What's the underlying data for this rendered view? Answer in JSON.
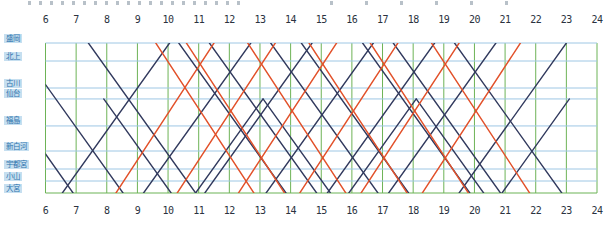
{
  "page": {
    "background_color": "#ffffff",
    "description_labels": {
      "top_axis": "time-of-day (hours)",
      "bottom_axis": "time-of-day (hours)",
      "left_column": "station names"
    }
  },
  "chart_data": {
    "type": "line",
    "title": "",
    "xlabel": "",
    "ylabel": "",
    "x_range": [
      6,
      24
    ],
    "tick_labels": [
      "6",
      "7",
      "8",
      "9",
      "10",
      "11",
      "12",
      "13",
      "14",
      "15",
      "16",
      "17",
      "18",
      "19",
      "20",
      "21",
      "22",
      "23",
      "24"
    ],
    "tick_labels_shown_top_and_bottom": true,
    "grid": {
      "vertical": "one green line per hour",
      "horizontal": "one light-blue line per station"
    },
    "stations": [
      {
        "name": "盛岡",
        "fraction": 0.0
      },
      {
        "name": "北上",
        "fraction": 0.12
      },
      {
        "name": "古川",
        "fraction": 0.3
      },
      {
        "name": "仙台",
        "fraction": 0.373
      },
      {
        "name": "福島",
        "fraction": 0.553
      },
      {
        "name": "新白河",
        "fraction": 0.72
      },
      {
        "name": "宇都宮",
        "fraction": 0.84
      },
      {
        "name": "小山",
        "fraction": 0.92
      },
      {
        "name": "大宮",
        "fraction": 1.0
      }
    ],
    "colors": {
      "navy_train": "#323a5e",
      "orange_train": "#e2512a",
      "hour_grid_green": "#6db356",
      "station_grid_blue": "#9ec7e4",
      "border_green": "#6db356",
      "axis_text": "#2a3240",
      "station_label_text": "#2f74ad",
      "station_label_bg": "#c6dff0"
    },
    "trains": [
      {
        "color": "navy",
        "direction": "down",
        "points": [
          [
            6.0,
            0.74
          ],
          [
            6.9,
            1.0
          ]
        ]
      },
      {
        "color": "navy",
        "direction": "down",
        "points": [
          [
            6.0,
            0.277
          ],
          [
            8.53,
            1.0
          ]
        ]
      },
      {
        "color": "navy",
        "direction": "down",
        "points": [
          [
            7.4,
            0.0
          ],
          [
            10.9,
            1.0
          ]
        ]
      },
      {
        "color": "navy",
        "direction": "down",
        "points": [
          [
            10.35,
            0.0
          ],
          [
            13.85,
            1.0
          ]
        ]
      },
      {
        "color": "navy",
        "direction": "down",
        "points": [
          [
            11.35,
            0.0
          ],
          [
            14.85,
            1.0
          ]
        ]
      },
      {
        "color": "navy",
        "direction": "down",
        "points": [
          [
            13.35,
            0.0
          ],
          [
            16.85,
            1.0
          ]
        ]
      },
      {
        "color": "navy",
        "direction": "down",
        "points": [
          [
            14.35,
            0.0
          ],
          [
            17.85,
            1.0
          ]
        ]
      },
      {
        "color": "navy",
        "direction": "down",
        "points": [
          [
            16.35,
            0.0
          ],
          [
            19.85,
            1.0
          ]
        ]
      },
      {
        "color": "navy",
        "direction": "down",
        "points": [
          [
            17.35,
            0.0
          ],
          [
            20.85,
            1.0
          ]
        ]
      },
      {
        "color": "navy",
        "direction": "down",
        "points": [
          [
            19.35,
            0.0
          ],
          [
            22.85,
            1.0
          ]
        ]
      },
      {
        "color": "navy",
        "direction": "up",
        "points": [
          [
            6.55,
            1.0
          ],
          [
            10.05,
            0.0
          ]
        ]
      },
      {
        "color": "navy",
        "direction": "up",
        "points": [
          [
            9.2,
            1.0
          ],
          [
            12.7,
            0.0
          ]
        ]
      },
      {
        "color": "navy",
        "direction": "up",
        "points": [
          [
            11.2,
            1.0
          ],
          [
            14.7,
            0.0
          ]
        ]
      },
      {
        "color": "navy",
        "direction": "up",
        "points": [
          [
            13.2,
            1.0
          ],
          [
            16.7,
            0.0
          ]
        ]
      },
      {
        "color": "navy",
        "direction": "up",
        "points": [
          [
            15.2,
            1.0
          ],
          [
            18.7,
            0.0
          ]
        ]
      },
      {
        "color": "navy",
        "direction": "up",
        "points": [
          [
            17.2,
            1.0
          ],
          [
            20.7,
            0.0
          ]
        ]
      },
      {
        "color": "navy",
        "direction": "up",
        "points": [
          [
            19.5,
            1.0
          ],
          [
            23.0,
            0.0
          ]
        ]
      },
      {
        "color": "navy",
        "direction": "down",
        "points": [
          [
            7.9,
            0.373
          ],
          [
            10.1,
            1.0
          ]
        ]
      },
      {
        "color": "navy",
        "direction": "down",
        "points": [
          [
            13.1,
            0.373
          ],
          [
            15.3,
            1.0
          ]
        ]
      },
      {
        "color": "navy",
        "direction": "down",
        "points": [
          [
            18.1,
            0.373
          ],
          [
            20.3,
            1.0
          ]
        ]
      },
      {
        "color": "navy",
        "direction": "up",
        "points": [
          [
            10.9,
            1.0
          ],
          [
            13.1,
            0.373
          ]
        ]
      },
      {
        "color": "navy",
        "direction": "up",
        "points": [
          [
            15.9,
            1.0
          ],
          [
            18.1,
            0.373
          ]
        ]
      },
      {
        "color": "navy",
        "direction": "up",
        "points": [
          [
            20.9,
            1.0
          ],
          [
            23.1,
            0.373
          ]
        ]
      },
      {
        "color": "orange",
        "direction": "down",
        "points": [
          [
            9.6,
            0.0
          ],
          [
            12.8,
            1.0
          ]
        ]
      },
      {
        "color": "orange",
        "direction": "down",
        "points": [
          [
            10.6,
            0.0
          ],
          [
            13.8,
            1.0
          ]
        ]
      },
      {
        "color": "orange",
        "direction": "down",
        "points": [
          [
            12.6,
            0.0
          ],
          [
            15.8,
            1.0
          ]
        ]
      },
      {
        "color": "orange",
        "direction": "down",
        "points": [
          [
            14.6,
            0.0
          ],
          [
            17.8,
            1.0
          ]
        ]
      },
      {
        "color": "orange",
        "direction": "down",
        "points": [
          [
            16.6,
            0.0
          ],
          [
            19.8,
            1.0
          ]
        ]
      },
      {
        "color": "orange",
        "direction": "down",
        "points": [
          [
            18.6,
            0.0
          ],
          [
            21.8,
            1.0
          ]
        ]
      },
      {
        "color": "orange",
        "direction": "up",
        "points": [
          [
            8.3,
            1.0
          ],
          [
            11.5,
            0.0
          ]
        ]
      },
      {
        "color": "orange",
        "direction": "up",
        "points": [
          [
            10.3,
            1.0
          ],
          [
            13.5,
            0.0
          ]
        ]
      },
      {
        "color": "orange",
        "direction": "up",
        "points": [
          [
            12.3,
            1.0
          ],
          [
            15.5,
            0.0
          ]
        ]
      },
      {
        "color": "orange",
        "direction": "up",
        "points": [
          [
            14.3,
            1.0
          ],
          [
            17.5,
            0.0
          ]
        ]
      },
      {
        "color": "orange",
        "direction": "up",
        "points": [
          [
            16.3,
            1.0
          ],
          [
            19.5,
            0.0
          ]
        ]
      },
      {
        "color": "orange",
        "direction": "up",
        "points": [
          [
            18.3,
            1.0
          ],
          [
            21.5,
            0.0
          ]
        ]
      }
    ]
  }
}
